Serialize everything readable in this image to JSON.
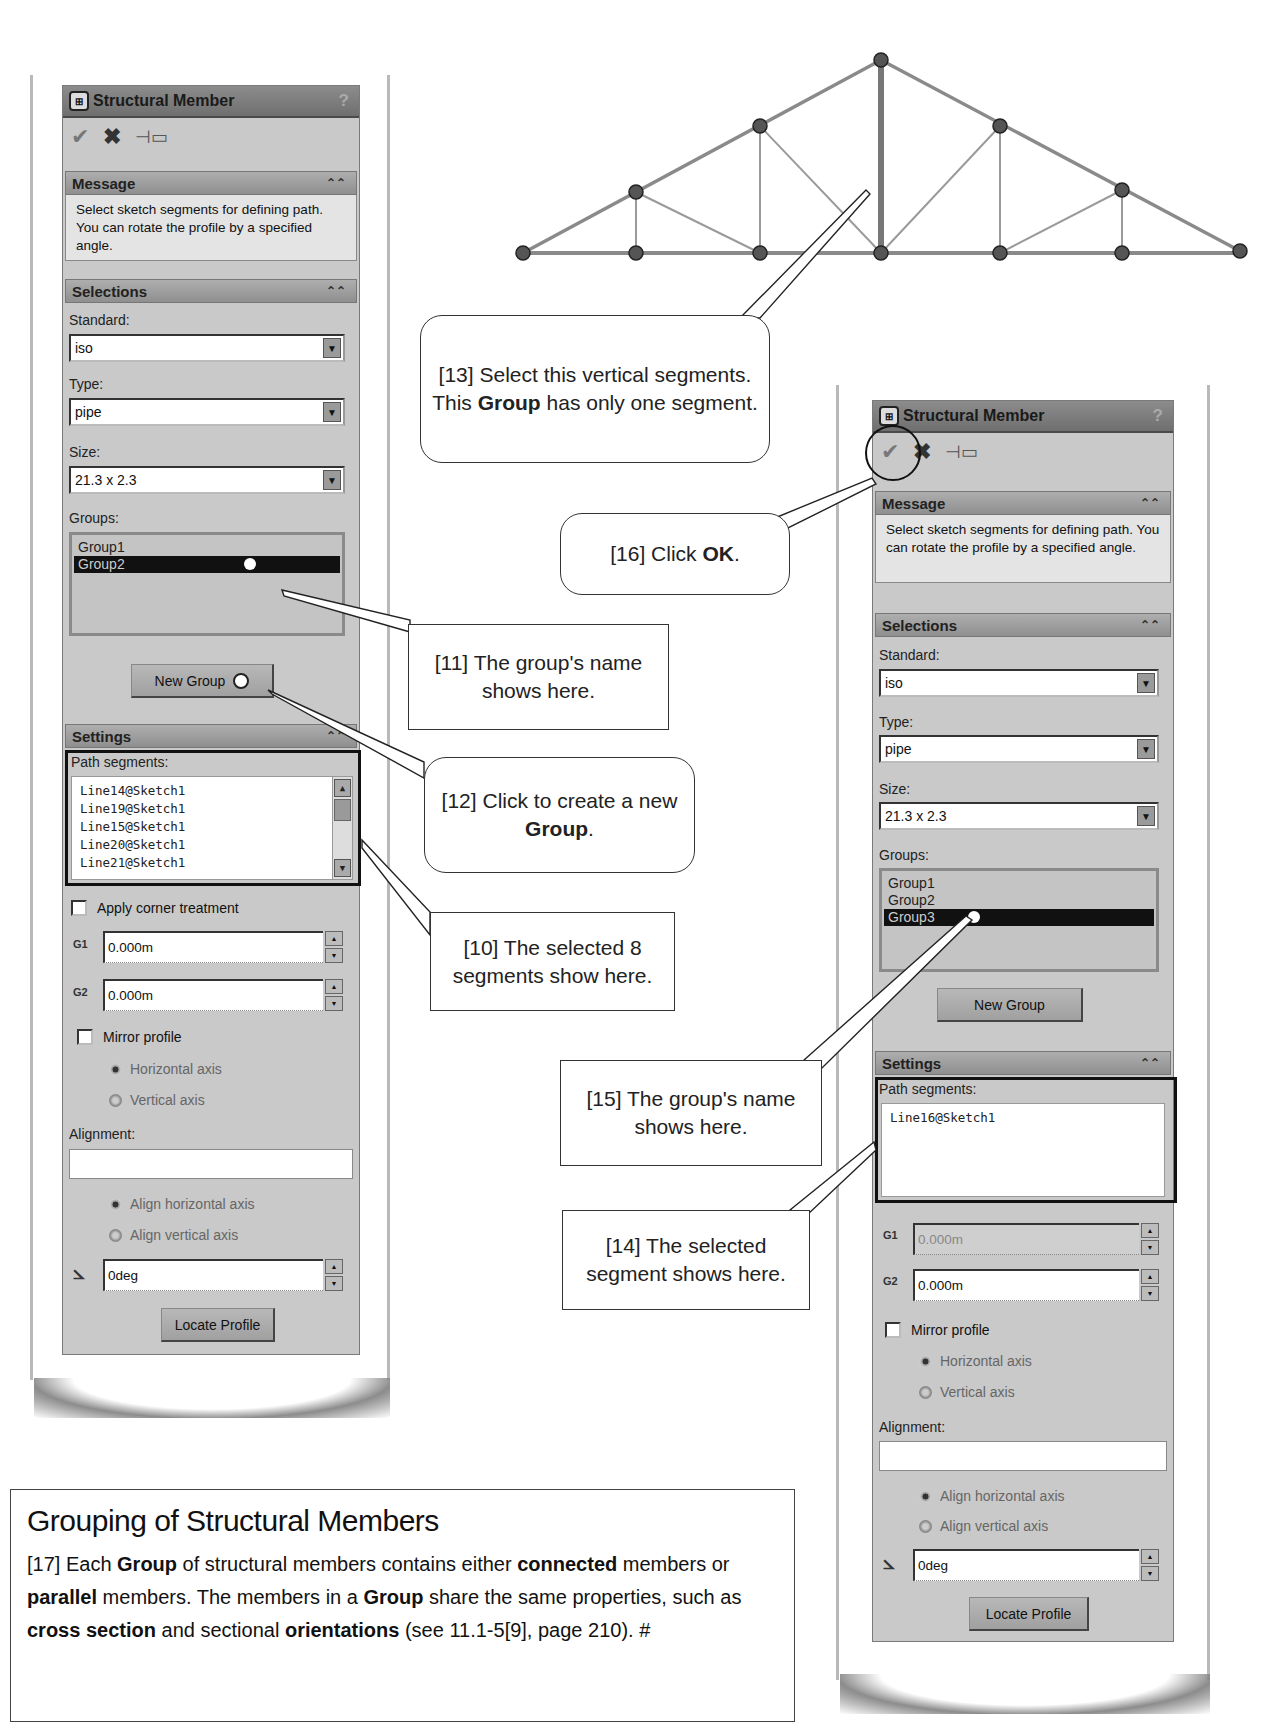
{
  "truss": {
    "description": "roof truss sketch",
    "highlighted_segment": "center vertical member",
    "nodes": [
      [
        523,
        253
      ],
      [
        636,
        192
      ],
      [
        760,
        126
      ],
      [
        881,
        60
      ],
      [
        1000,
        126
      ],
      [
        1122,
        190
      ],
      [
        1240,
        251
      ],
      [
        636,
        253
      ],
      [
        760,
        253
      ],
      [
        881,
        253
      ],
      [
        1000,
        253
      ],
      [
        1122,
        253
      ]
    ]
  },
  "left_panel": {
    "title": "Structural Member",
    "help": "?",
    "toolbar": {
      "ok_icon": "check-icon",
      "cancel_icon": "x-icon",
      "pin_icon": "pushpin-icon"
    },
    "message": {
      "header": "Message",
      "text": "Select sketch segments for defining path. You can rotate the profile by a specified angle."
    },
    "selections": {
      "header": "Selections",
      "standard_label": "Standard:",
      "standard_value": "iso",
      "type_label": "Type:",
      "type_value": "pipe",
      "size_label": "Size:",
      "size_value": "21.3 x 2.3",
      "groups_label": "Groups:",
      "groups": [
        "Group1",
        "Group2"
      ],
      "selected_group": "Group2",
      "new_group_button": "New Group"
    },
    "settings": {
      "header": "Settings",
      "path_segments_label": "Path segments:",
      "path_segments": [
        "Line14@Sketch1",
        "Line19@Sketch1",
        "Line15@Sketch1",
        "Line20@Sketch1",
        "Line21@Sketch1"
      ],
      "apply_corner_label": "Apply corner treatment",
      "g1_icon": "G1",
      "g1_value": "0.000m",
      "g2_icon": "G2",
      "g2_value": "0.000m",
      "mirror_label": "Mirror profile",
      "horizontal_axis": "Horizontal axis",
      "vertical_axis": "Vertical axis",
      "alignment_label": "Alignment:",
      "alignment_value": "",
      "align_horizontal": "Align horizontal axis",
      "align_vertical": "Align vertical axis",
      "angle_value": "0deg",
      "locate_profile_button": "Locate Profile"
    }
  },
  "right_panel": {
    "title": "Structural Member",
    "help": "?",
    "toolbar": {
      "ok_icon": "check-icon",
      "cancel_icon": "x-icon",
      "pin_icon": "pushpin-icon"
    },
    "message": {
      "header": "Message",
      "text": "Select sketch segments for defining path. You can rotate the profile by a specified angle."
    },
    "selections": {
      "header": "Selections",
      "standard_label": "Standard:",
      "standard_value": "iso",
      "type_label": "Type:",
      "type_value": "pipe",
      "size_label": "Size:",
      "size_value": "21.3 x 2.3",
      "groups_label": "Groups:",
      "groups": [
        "Group1",
        "Group2",
        "Group3"
      ],
      "selected_group": "Group3",
      "new_group_button": "New Group"
    },
    "settings": {
      "header": "Settings",
      "path_segments_label": "Path segments:",
      "path_segments": [
        "Line16@Sketch1"
      ],
      "g1_icon": "G1",
      "g1_value": "0.000m",
      "g2_icon": "G2",
      "g2_value": "0.000m",
      "mirror_label": "Mirror profile",
      "horizontal_axis": "Horizontal axis",
      "vertical_axis": "Vertical axis",
      "alignment_label": "Alignment:",
      "alignment_value": "",
      "align_horizontal": "Align horizontal axis",
      "align_vertical": "Align vertical axis",
      "angle_value": "0deg",
      "locate_profile_button": "Locate Profile"
    }
  },
  "callouts": {
    "c10": {
      "pre": "[10] The selected 8 segments show here.",
      "bold": "",
      "post": ""
    },
    "c11": {
      "pre": "[11] The group's name shows here.",
      "bold": "",
      "post": ""
    },
    "c12": {
      "pre": "[12] Click to create a new ",
      "bold": "Group",
      "post": "."
    },
    "c13": {
      "pre": "[13] Select this vertical segments. This ",
      "bold": "Group",
      "post": " has only one segment."
    },
    "c14": {
      "pre": "[14] The selected segment shows here.",
      "bold": "",
      "post": ""
    },
    "c15": {
      "pre": "[15] The group's name shows here.",
      "bold": "",
      "post": ""
    },
    "c16": {
      "pre": "[16] Click ",
      "bold": "OK",
      "post": "."
    }
  },
  "note": {
    "title": "Grouping of Structural Members",
    "parts": [
      {
        "t": "[17] Each ",
        "b": false
      },
      {
        "t": "Group",
        "b": true
      },
      {
        "t": " of structural members contains either ",
        "b": false
      },
      {
        "t": "connected",
        "b": true
      },
      {
        "t": " members or ",
        "b": false
      },
      {
        "t": "parallel",
        "b": true
      },
      {
        "t": " members. The members in a ",
        "b": false
      },
      {
        "t": "Group",
        "b": true
      },
      {
        "t": " share the same properties, such as ",
        "b": false
      },
      {
        "t": "cross section",
        "b": true
      },
      {
        "t": " and sectional ",
        "b": false
      },
      {
        "t": "orientations",
        "b": true
      },
      {
        "t": " (see 11.1-5[9], page 210). #",
        "b": false
      }
    ]
  }
}
